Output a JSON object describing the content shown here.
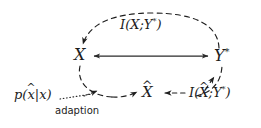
{
  "diagram": {
    "type": "information-bottleneck-graph",
    "background_color": "#ffffff",
    "stroke_color": "#1c1c1c",
    "nodes": [
      {
        "id": "x",
        "label": "X",
        "has_hat": false,
        "has_star": false
      },
      {
        "id": "ystar",
        "label": "Y",
        "has_hat": false,
        "has_star": true
      },
      {
        "id": "xhat",
        "label": "X",
        "has_hat": true,
        "has_star": false
      }
    ],
    "node_text": {
      "x": "X",
      "y_base": "Y",
      "y_star": "*",
      "xhat_base": "X",
      "xhat_hat": "^"
    },
    "labels": {
      "mi_top": {
        "full": "I(X;Y*)",
        "prefix": "I(X;",
        "base": "Y",
        "star": "*",
        "suffix": ")"
      },
      "mi_bottom": {
        "full": "I(X^;Y*)",
        "prefix": "I(",
        "hat_base": "X",
        "hat_mark": "^",
        "middle": ";",
        "base": "Y",
        "star": "*",
        "suffix": ")"
      },
      "adaption_dist": {
        "full": "p(x^|x)",
        "prefix": "p(",
        "hat_base": "x",
        "hat_mark": "^",
        "middle": "|x",
        "suffix": ")"
      },
      "adaption_caption": "adaption"
    },
    "edges": [
      {
        "id": "x-ystar",
        "style": "solid",
        "arrows": "both",
        "from": "X",
        "to": "Y*"
      },
      {
        "id": "arc-top",
        "style": "dashed",
        "arrows": "start",
        "from": "Y*",
        "to": "X",
        "annotation": "I(X;Y*)"
      },
      {
        "id": "arc-bottom",
        "style": "dashed",
        "arrows": "both",
        "from": "X",
        "to": "Y*",
        "annotation": "I(X^;Y*)"
      },
      {
        "id": "xhat-inflow",
        "style": "dashed",
        "arrows": "end",
        "from": "arc",
        "to": "X^"
      },
      {
        "id": "mi-to-xhat",
        "style": "dashed",
        "arrows": "end",
        "from": "I(X^;Y*)",
        "to": "X^"
      },
      {
        "id": "adaption-link",
        "style": "dotted",
        "arrows": "end",
        "from": "p(x^|x)",
        "to": "arc"
      }
    ]
  }
}
